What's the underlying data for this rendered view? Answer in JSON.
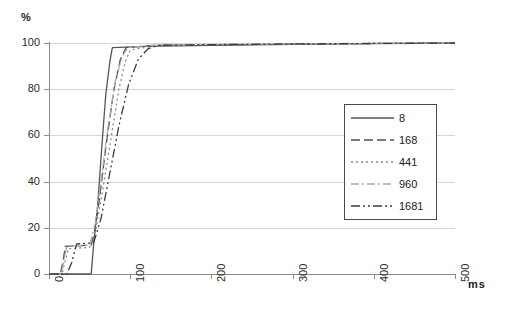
{
  "chart_data": {
    "type": "line",
    "title": "",
    "xlabel": "ms",
    "ylabel": "%",
    "xlim": [
      0,
      500
    ],
    "ylim": [
      0,
      100
    ],
    "grid": "horizontal",
    "legend_position": "center-right",
    "x_ticks": [
      "0",
      "100",
      "200",
      "300",
      "400",
      "500"
    ],
    "x_tick_values": [
      0,
      100,
      200,
      300,
      400,
      500
    ],
    "y_ticks": [
      "0",
      "20",
      "40",
      "60",
      "80",
      "100"
    ],
    "y_tick_values": [
      0,
      20,
      40,
      60,
      80,
      100
    ],
    "series": [
      {
        "name": "8",
        "style": "solid",
        "color": "#555555",
        "x": [
          0,
          18,
          20,
          52,
          55,
          60,
          65,
          70,
          75,
          78,
          120,
          200,
          300,
          400,
          500
        ],
        "y": [
          0,
          0,
          0,
          0,
          13,
          30,
          55,
          78,
          92,
          98,
          98.5,
          99,
          99.4,
          99.7,
          100
        ]
      },
      {
        "name": "168",
        "style": "dashed",
        "color": "#4f4f4f",
        "x": [
          0,
          14,
          18,
          20,
          52,
          56,
          62,
          70,
          80,
          88,
          95,
          130,
          200,
          300,
          400,
          500
        ],
        "y": [
          0,
          0,
          7,
          12,
          12.5,
          18,
          32,
          55,
          80,
          93,
          98,
          99,
          99.2,
          99.5,
          99.8,
          100
        ]
      },
      {
        "name": "441",
        "style": "dotted",
        "color": "#8a8a8a",
        "x": [
          0,
          16,
          20,
          24,
          50,
          58,
          66,
          76,
          86,
          94,
          100,
          135,
          200,
          300,
          400,
          500
        ],
        "y": [
          0,
          0,
          6,
          11,
          11.5,
          20,
          36,
          58,
          80,
          92,
          97,
          99,
          99.3,
          99.6,
          99.8,
          100
        ]
      },
      {
        "name": "960",
        "style": "dashdot-light",
        "color": "#adadad",
        "x": [
          0,
          15,
          19,
          22,
          50,
          57,
          64,
          72,
          82,
          90,
          97,
          130,
          200,
          300,
          400,
          500
        ],
        "y": [
          0,
          0,
          7,
          12,
          12.5,
          22,
          40,
          62,
          84,
          94,
          98,
          99.1,
          99.4,
          99.6,
          99.9,
          100
        ]
      },
      {
        "name": "1681",
        "style": "dashdotdot",
        "color": "#3d3d3d",
        "x": [
          0,
          22,
          28,
          34,
          55,
          64,
          74,
          86,
          98,
          110,
          122,
          135,
          200,
          300,
          400,
          500
        ],
        "y": [
          0,
          0,
          5,
          13,
          13.5,
          24,
          42,
          64,
          82,
          93,
          97.5,
          99,
          99.3,
          99.6,
          99.8,
          100
        ]
      }
    ]
  }
}
